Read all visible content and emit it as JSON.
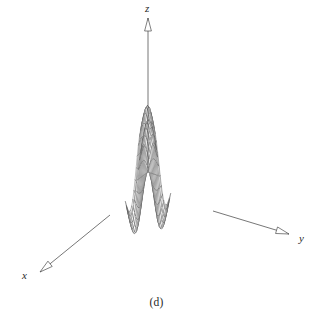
{
  "figure": {
    "caption": "(d)",
    "background_color": "#ffffff",
    "mesh_color": "#555555",
    "axis_color": "#4a4a4a",
    "label_color": "#2a2a2a"
  },
  "axes": {
    "x": {
      "label": "x",
      "arrow": "arrow-x-icon"
    },
    "y": {
      "label": "y",
      "arrow": "arrow-y-icon"
    },
    "z": {
      "label": "z",
      "arrow": "arrow-z-icon"
    }
  },
  "chart_data": {
    "type": "surface",
    "title": "",
    "xlabel": "x",
    "ylabel": "y",
    "zlabel": "z",
    "surface_kind": "saddle",
    "formula": "z = a*(x^2 - y^2) * exp(-(x^2+y^2)/s)",
    "grid_n": 21,
    "xlim": [
      -2.6,
      2.6
    ],
    "ylim": [
      -2.6,
      2.6
    ],
    "zlim": [
      -1.0,
      1.0
    ],
    "grid": true,
    "legend": "none",
    "projection": {
      "origin_px": [
        148,
        172
      ],
      "x_axis_vector_px": [
        -4.2,
        3.1
      ],
      "y_axis_vector_px": [
        4.55,
        1.55
      ],
      "z_axis_scale_px": 52
    },
    "axis_endpoints_px": {
      "x_tip": [
        40,
        272
      ],
      "y_tip": [
        289,
        234
      ],
      "z_tip": [
        148,
        18
      ]
    },
    "surface_extent_px": {
      "left_tip": [
        13,
        156
      ],
      "right_tip": [
        274,
        136
      ],
      "top_back": [
        148,
        88
      ],
      "bottom_front": [
        163,
        262
      ]
    }
  }
}
